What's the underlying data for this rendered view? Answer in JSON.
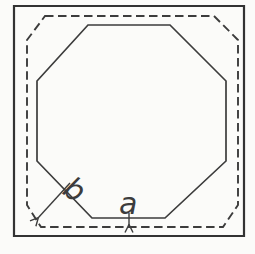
{
  "figure": {
    "background_color": "#fbfbf9",
    "line_color": "#3c3c3c",
    "outer_line_color": "#333333"
  },
  "labels": {
    "dim_a": "a",
    "dim_b": "b"
  },
  "geometry": {
    "outer_square": "14,6 244,6 244,236 14,236",
    "dashed_outline": "45,16 214,16 238,40 238,205 223,227 41,227 27,205 27,40",
    "octagon": "88,25 170,25 226,81 226,161 165,218 92,218 37,161 37,81",
    "arrow_b": "M70,183 L38,218",
    "arrow_a": "M129,213 L129,225",
    "label_b_pos": {
      "x": "61",
      "y": "193",
      "transform": "rotate(33 61 193)"
    },
    "label_a_pos": {
      "x": "119",
      "y": "214"
    }
  }
}
